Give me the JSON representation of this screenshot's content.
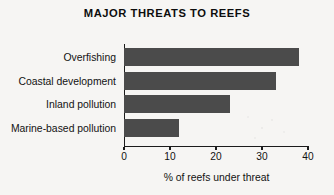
{
  "chart_data": {
    "type": "bar",
    "orientation": "horizontal",
    "title": "MAJOR THREATS TO REEFS",
    "xlabel": "% of reefs under threat",
    "ylabel": "",
    "categories": [
      "Overfishing",
      "Coastal development",
      "Inland pollution",
      "Marine-based pollution"
    ],
    "values": [
      38,
      33,
      23,
      12
    ],
    "xlim": [
      0,
      40
    ],
    "xticks": [
      0,
      10,
      20,
      30,
      40
    ],
    "xtick_labels": [
      "0",
      "10",
      "20",
      "30",
      "40"
    ],
    "grid": false,
    "legend": false,
    "series": [
      {
        "name": "% of reefs under threat",
        "values": [
          38,
          33,
          23,
          12
        ]
      }
    ],
    "bars": [
      {
        "label": "Overfishing",
        "value": 38
      },
      {
        "label": "Coastal development",
        "value": 33
      },
      {
        "label": "Inland pollution",
        "value": 23
      },
      {
        "label": "Marine-based pollution",
        "value": 12
      }
    ],
    "colors": {
      "bar": "#4b4b4b",
      "axis": "#1b1b1b",
      "text": "#121212",
      "background": "#f6f5f3"
    }
  }
}
